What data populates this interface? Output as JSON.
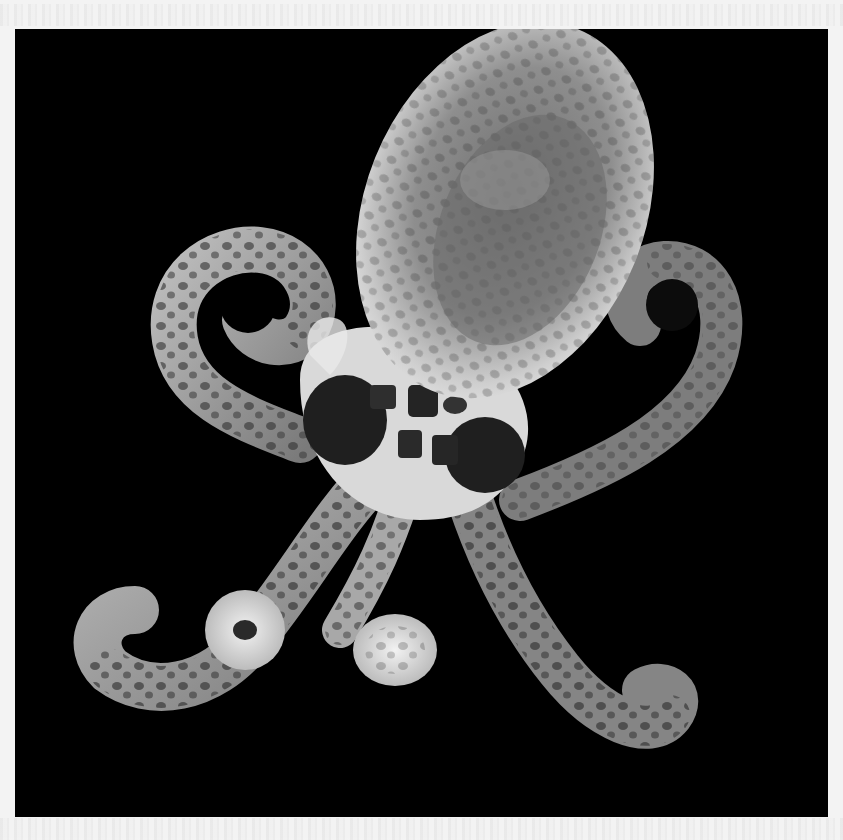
{
  "image": {
    "subject": "Octopus photographed on a black background",
    "alt": "Grayscale photograph of a translucent spotted octopus with curled arms against a black background",
    "palette": {
      "background": "#000000",
      "page": "#f3f3f3",
      "body_light": "#d8d8d8",
      "body_mid": "#8a8a8a",
      "spots": "#2a2a2a"
    },
    "frame": {
      "x": 15,
      "y": 29,
      "width": 813,
      "height": 788
    }
  }
}
